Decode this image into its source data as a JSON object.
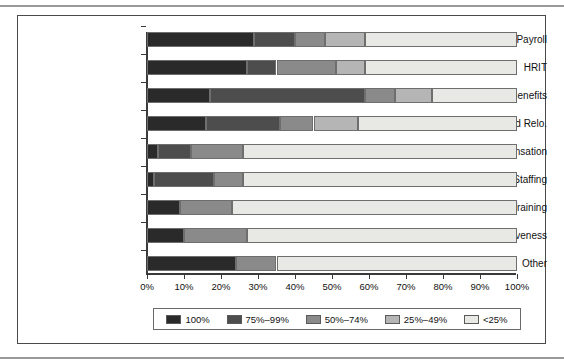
{
  "chart_data": {
    "type": "bar",
    "orientation": "horizontal",
    "stacked": true,
    "title": "",
    "subtitle": "",
    "xlabel": "",
    "ylabel": "",
    "xlim": [
      0,
      100
    ],
    "grid": false,
    "legend_position": "bottom",
    "xticks": [
      "0%",
      "10%",
      "20%",
      "30%",
      "40%",
      "50%",
      "60%",
      "70%",
      "80%",
      "90%",
      "100%"
    ],
    "xtick_values": [
      0,
      10,
      20,
      30,
      40,
      50,
      60,
      70,
      80,
      90,
      100
    ],
    "categories": [
      "Payroll",
      "HRIT",
      "Benefits",
      "Expat and Relo.",
      "Compensation",
      "Recruiting/Staffing",
      "Learning/Training",
      "Org. Effectiveness",
      "Other"
    ],
    "series": [
      {
        "name": "100%",
        "color": "#2a2a2a",
        "values": [
          29,
          27,
          17,
          16,
          3,
          2,
          9,
          10,
          24
        ]
      },
      {
        "name": "75%-99%",
        "color": "#4d4d4d",
        "values": [
          11,
          8,
          42,
          20,
          9,
          16,
          0,
          0,
          0
        ]
      },
      {
        "name": "50%-74%",
        "color": "#8a8a8a",
        "values": [
          8,
          16,
          8,
          9,
          14,
          8,
          14,
          17,
          11
        ]
      },
      {
        "name": "25%-49%",
        "color": "#b5b5b5",
        "values": [
          11,
          8,
          10,
          12,
          0,
          0,
          0,
          0,
          0
        ]
      },
      {
        "name": "<25%",
        "color": "#e8e8e4",
        "values": [
          41,
          41,
          23,
          43,
          74,
          74,
          77,
          73,
          65
        ]
      }
    ],
    "legend": [
      {
        "label": "100%",
        "color": "#2a2a2a"
      },
      {
        "label": "75%–99%",
        "color": "#4d4d4d"
      },
      {
        "label": "50%–74%",
        "color": "#8a8a8a"
      },
      {
        "label": "25%–49%",
        "color": "#b5b5b5"
      },
      {
        "label": "<25%",
        "color": "#e8e8e4"
      }
    ]
  }
}
